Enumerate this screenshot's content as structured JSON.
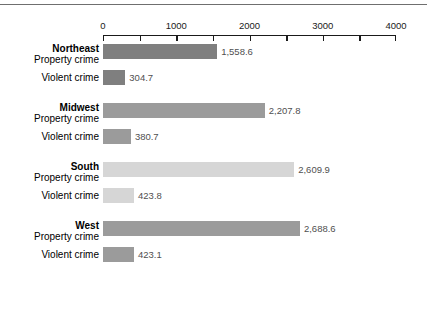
{
  "chart_data": {
    "type": "bar",
    "orientation": "horizontal",
    "title": "",
    "subtitle": "",
    "xlabel": "",
    "ylabel": "",
    "xlim": [
      0,
      4000
    ],
    "grid": false,
    "legend_position": "none",
    "axis_tick_values": [
      0,
      500,
      1000,
      1500,
      2000,
      2500,
      3000,
      3500,
      4000
    ],
    "axis_tick_labels": [
      "0",
      "",
      "1000",
      "",
      "2000",
      "",
      "3000",
      "",
      "4000"
    ],
    "series_names": [
      "Property crime",
      "Violent crime"
    ],
    "categories": [
      "Northeast",
      "Midwest",
      "South",
      "West"
    ],
    "groups": [
      {
        "region": "Northeast",
        "color": "#7f7f7f",
        "rows": [
          {
            "series": "Property crime",
            "value": 1558.6,
            "value_label": "1,558.6"
          },
          {
            "series": "Violent crime",
            "value": 304.7,
            "value_label": "304.7"
          }
        ]
      },
      {
        "region": "Midwest",
        "color": "#9b9b9b",
        "rows": [
          {
            "series": "Property crime",
            "value": 2207.8,
            "value_label": "2,207.8"
          },
          {
            "series": "Violent crime",
            "value": 380.7,
            "value_label": "380.7"
          }
        ]
      },
      {
        "region": "South",
        "color": "#d6d6d6",
        "rows": [
          {
            "series": "Property crime",
            "value": 2609.9,
            "value_label": "2,609.9"
          },
          {
            "series": "Violent crime",
            "value": 423.8,
            "value_label": "423.8"
          }
        ]
      },
      {
        "region": "West",
        "color": "#9b9b9b",
        "rows": [
          {
            "series": "Property crime",
            "value": 2688.6,
            "value_label": "2,688.6"
          },
          {
            "series": "Violent crime",
            "value": 423.1,
            "value_label": "423.1"
          }
        ]
      }
    ]
  },
  "colors": {
    "axis": "#1a1a1a",
    "value_text": "#4f4f4f",
    "label_text": "#000000",
    "top_rule": "#6f6f6f",
    "background": "#ffffff"
  }
}
